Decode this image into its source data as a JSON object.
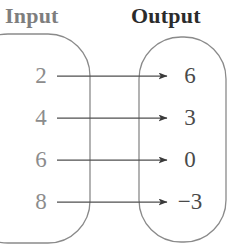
{
  "diagram": {
    "type": "mapping-diagram",
    "headings": {
      "input": "Input",
      "output": "Output"
    },
    "colors": {
      "input_text": "#8c8c8c",
      "input_heading": "#7e7e7e",
      "output_text": "#4a4a4a",
      "output_heading": "#2b2b2b",
      "box_stroke": "#8a8a8a",
      "arrow_stroke": "#4f4f4f",
      "background": "#ffffff"
    },
    "pairs": [
      {
        "input": "2",
        "output": "6"
      },
      {
        "input": "4",
        "output": "3"
      },
      {
        "input": "6",
        "output": "0"
      },
      {
        "input": "8",
        "output": "−3"
      }
    ]
  }
}
